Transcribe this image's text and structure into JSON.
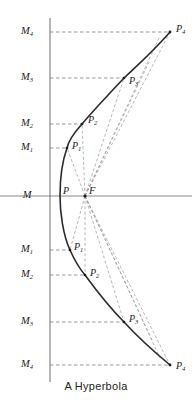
{
  "figure": {
    "caption": "A Hyperbola",
    "title": "A Hyperbola",
    "type": "geometric-construction",
    "colors": {
      "curve": "#2b2b2b",
      "axis": "#8a8a8a",
      "directrix": "#6e6e6e",
      "dashed_ordinate": "#7f7f7f",
      "dashed_radius": "#9a9a9a",
      "background": "#ffffff",
      "label": "#1b1b1b"
    },
    "axis": {
      "horizontal_label": "M",
      "horizontal_y": 196,
      "directrix_x": 50
    },
    "focus": {
      "label": "F",
      "x": 85,
      "y": 196
    },
    "vertex": {
      "label": "P",
      "x": 60,
      "y": 196
    },
    "directrix_points": [
      {
        "label": "M",
        "sub": "4",
        "x": 50,
        "y": 32,
        "label_x": 27,
        "label_y": 32
      },
      {
        "label": "M",
        "sub": "3",
        "x": 50,
        "y": 78,
        "label_x": 27,
        "label_y": 78
      },
      {
        "label": "M",
        "sub": "2",
        "x": 50,
        "y": 124,
        "label_x": 27,
        "label_y": 124
      },
      {
        "label": "M",
        "sub": "1",
        "x": 50,
        "y": 148,
        "label_x": 27,
        "label_y": 148
      },
      {
        "label": "M",
        "sub": "",
        "x": 50,
        "y": 196,
        "label_x": 27,
        "label_y": 196
      },
      {
        "label": "M",
        "sub": "1",
        "x": 50,
        "y": 250,
        "label_x": 27,
        "label_y": 250
      },
      {
        "label": "M",
        "sub": "2",
        "x": 50,
        "y": 275,
        "label_x": 27,
        "label_y": 275
      },
      {
        "label": "M",
        "sub": "3",
        "x": 50,
        "y": 322,
        "label_x": 27,
        "label_y": 322
      },
      {
        "label": "M",
        "sub": "4",
        "x": 50,
        "y": 365,
        "label_x": 27,
        "label_y": 365
      }
    ],
    "curve_points": [
      {
        "label": "P",
        "sub": "4",
        "x": 170,
        "y": 32,
        "label_x": 176,
        "label_y": 30
      },
      {
        "label": "P",
        "sub": "3",
        "x": 124,
        "y": 78,
        "label_x": 129,
        "label_y": 82
      },
      {
        "label": "P",
        "sub": "2",
        "x": 82,
        "y": 124,
        "label_x": 88,
        "label_y": 121
      },
      {
        "label": "P",
        "sub": "1",
        "x": 67,
        "y": 148,
        "label_x": 72,
        "label_y": 147
      },
      {
        "label": "P",
        "sub": "",
        "x": 60,
        "y": 196,
        "label_x": 63,
        "label_y": 192
      },
      {
        "label": "P",
        "sub": "1",
        "x": 70,
        "y": 250,
        "label_x": 74,
        "label_y": 248
      },
      {
        "label": "P",
        "sub": "2",
        "x": 85,
        "y": 275,
        "label_x": 90,
        "label_y": 274
      },
      {
        "label": "P",
        "sub": "3",
        "x": 124,
        "y": 322,
        "label_x": 129,
        "label_y": 320
      },
      {
        "label": "P",
        "sub": "4",
        "x": 170,
        "y": 365,
        "label_x": 176,
        "label_y": 367
      }
    ]
  }
}
